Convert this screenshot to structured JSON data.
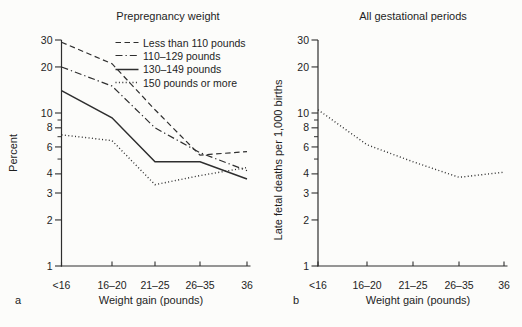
{
  "colors": {
    "line": "#2e2e2e",
    "text": "#1e1e1e",
    "background": "#fcfcfa"
  },
  "chart_data": [
    {
      "type": "line",
      "panel": "a",
      "title": "Prepregnancy weight",
      "xlabel": "Weight gain (pounds)",
      "ylabel": "Percent",
      "x_categories": [
        "<16",
        "16–20",
        "21–25",
        "26–35",
        "36"
      ],
      "y_scale": "log",
      "ylim": [
        1,
        30
      ],
      "y_ticks_labeled": [
        30,
        20,
        10,
        8,
        6,
        4,
        3,
        2,
        1
      ],
      "y_ticks_minor": [
        9,
        7,
        5
      ],
      "grid": false,
      "legend_position": "top-right-inside",
      "series": [
        {
          "name": "Less than 110 pounds",
          "line_style": "dashed",
          "values": [
            29,
            21,
            10.5,
            5.3,
            5.6
          ]
        },
        {
          "name": "110–129 pounds",
          "line_style": "dash-dot",
          "values": [
            20,
            15,
            8.0,
            5.5,
            4.2
          ]
        },
        {
          "name": "130–149 pounds",
          "line_style": "solid",
          "values": [
            14,
            9.3,
            4.8,
            4.8,
            3.7
          ]
        },
        {
          "name": "150 pounds or more",
          "line_style": "dotted",
          "values": [
            7.2,
            6.6,
            3.4,
            3.9,
            4.4
          ]
        }
      ]
    },
    {
      "type": "line",
      "panel": "b",
      "title": "All gestational periods",
      "xlabel": "Weight gain (pounds)",
      "ylabel": "Late fetal deaths per 1,000 births",
      "x_categories": [
        "<16",
        "16–20",
        "21–25",
        "26–35",
        "36"
      ],
      "y_scale": "log",
      "ylim": [
        1,
        30
      ],
      "y_ticks_labeled": [
        30,
        20,
        10,
        8,
        6,
        4,
        3,
        2,
        1
      ],
      "y_ticks_minor": [
        9,
        7,
        5
      ],
      "grid": false,
      "series": [
        {
          "name": "All gestational periods",
          "line_style": "dotted",
          "values": [
            10.5,
            6.2,
            4.8,
            3.8,
            4.1
          ]
        }
      ]
    }
  ]
}
